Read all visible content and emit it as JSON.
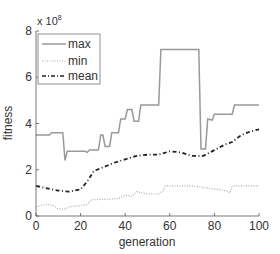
{
  "chart_data": {
    "type": "line",
    "title": "",
    "xlabel": "generation",
    "ylabel": "fitness",
    "y_multiplier_label": "x 10",
    "y_multiplier_exp": "8",
    "xlim": [
      0,
      100
    ],
    "ylim": [
      0,
      8
    ],
    "xticks": [
      0,
      20,
      40,
      60,
      80,
      100
    ],
    "yticks": [
      0,
      2,
      4,
      6,
      8
    ],
    "grid": false,
    "legend_position": "upper left",
    "series": [
      {
        "name": "max",
        "style": "solid",
        "color": "#999999",
        "points": [
          [
            0,
            3.5
          ],
          [
            6,
            3.5
          ],
          [
            7,
            3.6
          ],
          [
            12,
            3.6
          ],
          [
            13,
            2.4
          ],
          [
            14,
            2.8
          ],
          [
            22,
            2.8
          ],
          [
            23,
            2.75
          ],
          [
            24,
            2.85
          ],
          [
            28,
            2.85
          ],
          [
            29,
            3.5
          ],
          [
            30,
            3.5
          ],
          [
            31,
            3.0
          ],
          [
            33,
            3.0
          ],
          [
            34,
            3.6
          ],
          [
            37,
            3.6
          ],
          [
            38,
            4.2
          ],
          [
            40,
            4.2
          ],
          [
            41,
            4.6
          ],
          [
            43,
            4.6
          ],
          [
            44,
            4.1
          ],
          [
            46,
            4.1
          ],
          [
            47,
            4.8
          ],
          [
            55,
            4.8
          ],
          [
            56,
            7.2
          ],
          [
            73,
            7.2
          ],
          [
            74,
            2.9
          ],
          [
            76,
            2.9
          ],
          [
            77,
            4.2
          ],
          [
            79,
            4.15
          ],
          [
            80,
            4.4
          ],
          [
            88,
            4.4
          ],
          [
            89,
            4.8
          ],
          [
            100,
            4.8
          ]
        ]
      },
      {
        "name": "min",
        "style": "dotted",
        "color": "#aaaaaa",
        "points": [
          [
            0,
            0.4
          ],
          [
            5,
            0.5
          ],
          [
            8,
            0.45
          ],
          [
            10,
            0.3
          ],
          [
            13,
            0.3
          ],
          [
            15,
            0.4
          ],
          [
            20,
            0.45
          ],
          [
            23,
            0.5
          ],
          [
            25,
            0.7
          ],
          [
            37,
            0.75
          ],
          [
            40,
            0.9
          ],
          [
            43,
            0.85
          ],
          [
            45,
            1.05
          ],
          [
            50,
            0.95
          ],
          [
            55,
            0.95
          ],
          [
            57,
            1.1
          ],
          [
            58,
            1.3
          ],
          [
            70,
            1.3
          ],
          [
            78,
            1.2
          ],
          [
            85,
            1.1
          ],
          [
            87,
            1.0
          ],
          [
            88,
            1.3
          ],
          [
            100,
            1.3
          ]
        ]
      },
      {
        "name": "mean",
        "style": "dashdot",
        "color": "#222222",
        "points": [
          [
            0,
            1.3
          ],
          [
            5,
            1.2
          ],
          [
            10,
            1.1
          ],
          [
            15,
            1.05
          ],
          [
            20,
            1.15
          ],
          [
            23,
            1.5
          ],
          [
            26,
            1.95
          ],
          [
            30,
            2.1
          ],
          [
            35,
            2.3
          ],
          [
            40,
            2.45
          ],
          [
            45,
            2.6
          ],
          [
            50,
            2.65
          ],
          [
            55,
            2.65
          ],
          [
            60,
            2.8
          ],
          [
            65,
            2.75
          ],
          [
            70,
            2.6
          ],
          [
            75,
            2.6
          ],
          [
            80,
            2.85
          ],
          [
            85,
            3.1
          ],
          [
            88,
            3.2
          ],
          [
            92,
            3.5
          ],
          [
            96,
            3.65
          ],
          [
            100,
            3.75
          ]
        ]
      }
    ]
  }
}
